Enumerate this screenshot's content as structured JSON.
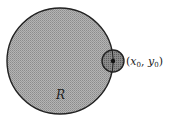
{
  "diagram": {
    "region": {
      "label": "R",
      "center": [
        60,
        61
      ],
      "radius": 53,
      "fill": "#a8a8a8",
      "stroke": "#222222"
    },
    "neighborhood": {
      "center": [
        113,
        61
      ],
      "radius": 11,
      "fill": "#8a8a8a",
      "stroke": "#222222"
    },
    "point": {
      "label": "(x₀, y₀)",
      "label_open": "(",
      "x_var": "x",
      "x_sub": "0",
      "sep": ", ",
      "y_var": "y",
      "y_sub": "0",
      "label_close": ")"
    }
  }
}
